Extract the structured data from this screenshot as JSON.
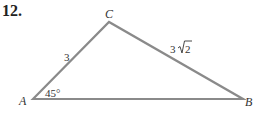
{
  "problem": {
    "number": "12."
  },
  "diagram": {
    "type": "triangle",
    "vertices": {
      "A": {
        "label": "A",
        "x": 33,
        "y": 99
      },
      "B": {
        "label": "B",
        "x": 243,
        "y": 99
      },
      "C": {
        "label": "C",
        "x": 109,
        "y": 22
      }
    },
    "side_labels": {
      "AC": "3",
      "CB_coef": "3",
      "CB_radicand": "2"
    },
    "angle_labels": {
      "A": "45°"
    },
    "colors": {
      "stroke": "#8a8a8a",
      "text": "#333333"
    }
  }
}
